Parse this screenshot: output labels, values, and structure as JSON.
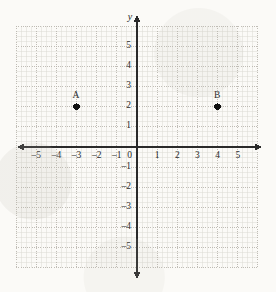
{
  "figure": {
    "kind": "coordinate-plane",
    "background_color": "#fbfaf7",
    "ink_color": "#2a2a2a",
    "grid_color": "#b9b6ae",
    "subgrid_color": "#dcdad3"
  },
  "axes": {
    "y_axis_title": "y",
    "origin_label": "0",
    "x_tick_labels": [
      "–5",
      "–4",
      "–3",
      "–2",
      "–1",
      "1",
      "2",
      "3",
      "4",
      "5"
    ],
    "y_tick_labels_positive": [
      "1",
      "2",
      "3",
      "4",
      "5"
    ],
    "y_tick_labels_negative": [
      "–1",
      "–2",
      "–3",
      "–4",
      "–5"
    ]
  },
  "chart_data": {
    "type": "scatter",
    "title": "",
    "xlabel": "",
    "ylabel": "y",
    "xlim": [
      -6,
      6
    ],
    "ylim": [
      -6,
      6
    ],
    "xticks": [
      -5,
      -4,
      -3,
      -2,
      -1,
      0,
      1,
      2,
      3,
      4,
      5
    ],
    "yticks": [
      -5,
      -4,
      -3,
      -2,
      -1,
      0,
      1,
      2,
      3,
      4,
      5
    ],
    "grid": true,
    "minor_grid": true,
    "minor_grid_divisions": 4,
    "legend": false,
    "points": [
      {
        "label": "A",
        "x": -3,
        "y": 2
      },
      {
        "label": "B",
        "x": 4,
        "y": 2
      }
    ]
  }
}
